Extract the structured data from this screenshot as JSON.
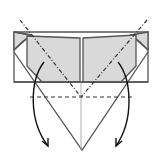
{
  "diagram": {
    "type": "origami-fold-step",
    "colors": {
      "background": "#ffffff",
      "paper_back": "#d9d9d9",
      "line": "#555555",
      "arrow": "#111111"
    },
    "elements": {
      "left_flap": "gray square flap",
      "right_flap": "gray square flap",
      "valley_fold_line": "dashed horizontal",
      "mountain_fold_lines": "dash-dot diagonals",
      "center_crease": "thin vertical",
      "arrows": [
        "left-down curved arrow",
        "right-down curved arrow"
      ]
    }
  }
}
